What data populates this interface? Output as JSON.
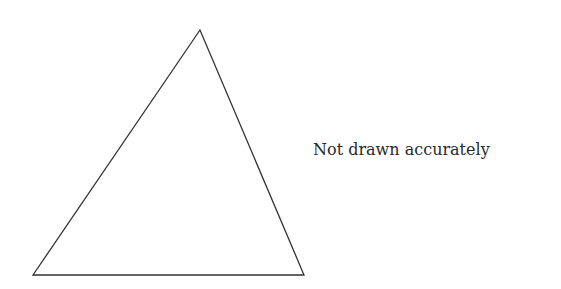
{
  "diagram": {
    "shape": "triangle",
    "vertices": {
      "apex": [
        200,
        30
      ],
      "bottom_left": [
        33,
        275
      ],
      "bottom_right": [
        304,
        275
      ]
    },
    "stroke_color": "#333333",
    "fill_color": "#ffffff"
  },
  "caption": {
    "text": "Not drawn accurately"
  }
}
